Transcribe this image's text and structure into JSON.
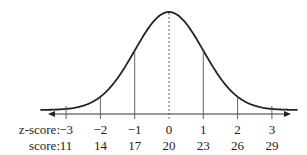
{
  "chart_data": {
    "type": "line",
    "title": "",
    "rows": [
      {
        "label": "z-score:",
        "values": [
          "−3",
          "−2",
          "−1",
          "0",
          "1",
          "2",
          "3"
        ]
      },
      {
        "label": "score:",
        "values": [
          "11",
          "14",
          "17",
          "20",
          "23",
          "26",
          "29"
        ]
      }
    ],
    "z": [
      -3,
      -2,
      -1,
      0,
      1,
      2,
      3
    ],
    "score": [
      11,
      14,
      17,
      20,
      23,
      26,
      29
    ],
    "mean": 20,
    "sd": 3,
    "mean_line": "dashed",
    "grid": false,
    "colors": {
      "curve": "#222222",
      "axis": "#333333",
      "lines": "#555555"
    }
  }
}
